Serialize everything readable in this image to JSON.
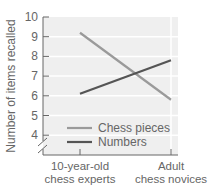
{
  "chart_data": {
    "type": "line",
    "title": "",
    "xlabel": "",
    "ylabel": "Number of items recalled",
    "categories": [
      "10-year-old chess experts",
      "Adult chess novices"
    ],
    "category_lines": [
      [
        "10-year-old",
        "chess experts"
      ],
      [
        "Adult",
        "chess novices"
      ]
    ],
    "series": [
      {
        "name": "Chess pieces",
        "values": [
          9.2,
          5.8
        ],
        "color": "#9a9a9a"
      },
      {
        "name": "Numbers",
        "values": [
          6.1,
          7.8
        ],
        "color": "#555555"
      }
    ],
    "ylim": [
      4,
      10
    ],
    "yticks": [
      4,
      5,
      6,
      7,
      8,
      9,
      10
    ],
    "axis_break": true,
    "grid": true,
    "legend_position": "lower-left inside plot",
    "colors": {
      "plot_background": "#efefef",
      "gridline": "#ffffff",
      "axis": "#666666"
    }
  }
}
